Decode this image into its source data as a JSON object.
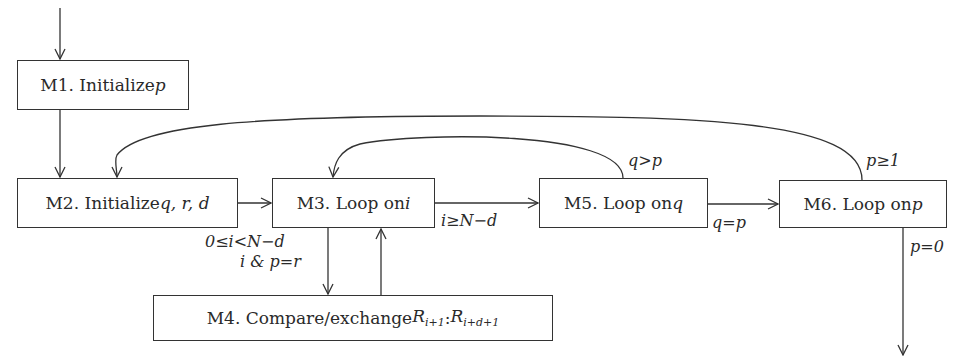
{
  "diagram": {
    "type": "flowchart",
    "nodes": [
      {
        "id": "M1",
        "prefix": "M1. Initialize ",
        "var": "p"
      },
      {
        "id": "M2",
        "prefix": "M2. Initialize ",
        "var": "q, r, d"
      },
      {
        "id": "M3",
        "prefix": "M3. Loop on ",
        "var": "i"
      },
      {
        "id": "M4",
        "prefix": "M4. Compare/exchange ",
        "var": "R",
        "sub1": "i+1",
        "sep": ":",
        "var2": "R",
        "sub2": "i+d+1"
      },
      {
        "id": "M5",
        "prefix": "M5. Loop on ",
        "var": "q"
      },
      {
        "id": "M6",
        "prefix": "M6. Loop on ",
        "var": "p"
      }
    ],
    "edges": [
      {
        "from": "start",
        "to": "M1",
        "label": ""
      },
      {
        "from": "M1",
        "to": "M2",
        "label": ""
      },
      {
        "from": "M2",
        "to": "M3",
        "label": ""
      },
      {
        "from": "M3",
        "to": "M4",
        "label": "0≤i<N−d / i & p = r"
      },
      {
        "from": "M4",
        "to": "M3",
        "label": ""
      },
      {
        "from": "M3",
        "to": "M5",
        "label": "i≥N−d"
      },
      {
        "from": "M5",
        "to": "M3",
        "label": "q>p"
      },
      {
        "from": "M5",
        "to": "M6",
        "label": "q=p"
      },
      {
        "from": "M6",
        "to": "M2",
        "label": "p≥1"
      },
      {
        "from": "M6",
        "to": "end",
        "label": "p=0"
      }
    ],
    "labels": {
      "m3_m4_line1": "0≤i<N−d",
      "m3_m4_line2": "i & p=r",
      "m3_m5": "i≥N−d",
      "m5_m3": "q>p",
      "m5_m6": "q=p",
      "m6_m2": "p≥1",
      "m6_end": "p=0"
    }
  }
}
